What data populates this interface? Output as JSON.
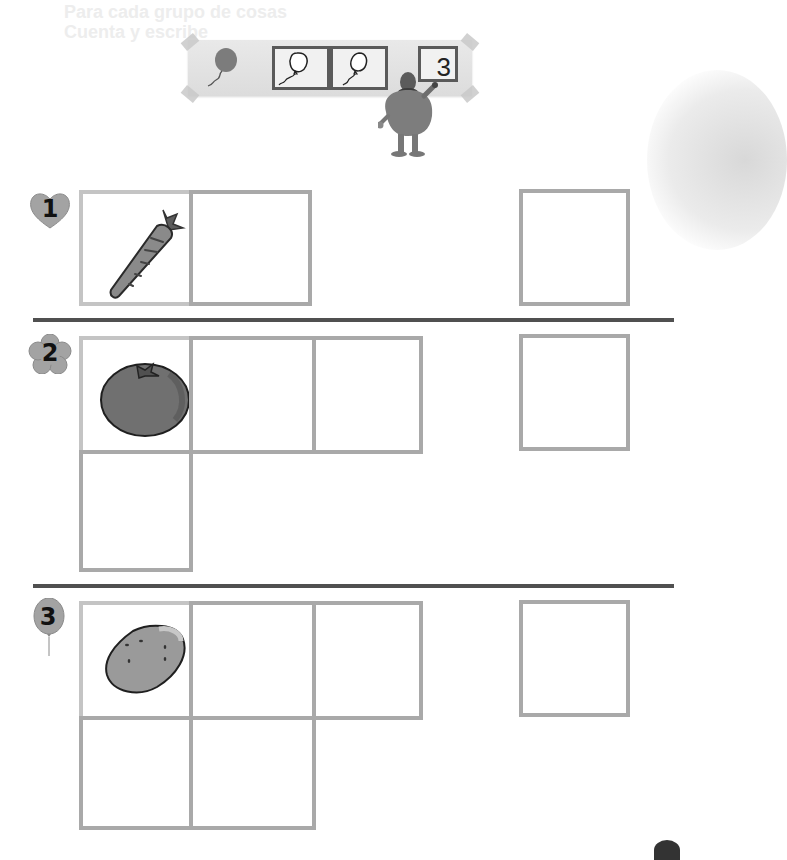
{
  "page": {
    "bleed_through_text": "Para cada grupo de cosas\nCuenta y escribe",
    "colors": {
      "background": "#ffffff",
      "cell_border": "#a9a9a9",
      "first_cell_border": "#c4c4c4",
      "divider": "#505050",
      "banner_bg": "#e2e2e2",
      "banner_frame": "#5a5a5a",
      "badge_fill": "#9a9a9a"
    }
  },
  "banner": {
    "icons": [
      "balloon-icon",
      "balloon-outline-icon",
      "balloon-outline-icon"
    ],
    "written_number": "3",
    "character": "fuzzy-monster-writing"
  },
  "sections": [
    {
      "number": "1",
      "badge_shape": "heart",
      "item": "carrot",
      "grid_cells": 2,
      "answer_box": ""
    },
    {
      "number": "2",
      "badge_shape": "flower",
      "item": "tomato",
      "grid_cells": 4,
      "answer_box": ""
    },
    {
      "number": "3",
      "badge_shape": "balloon",
      "item": "potato",
      "grid_cells": 5,
      "answer_box": ""
    }
  ]
}
